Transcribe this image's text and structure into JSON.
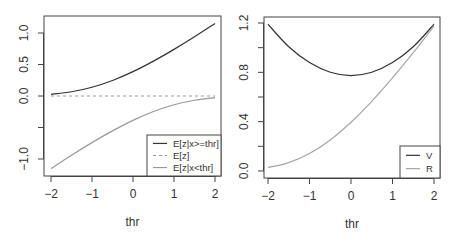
{
  "chart_data": [
    {
      "type": "line",
      "title": "",
      "xlabel": "thr",
      "ylabel": "",
      "xlim": [
        -2,
        2
      ],
      "ylim": [
        -1.2,
        1.25
      ],
      "x_ticks": [
        -2,
        -1,
        0,
        1,
        2
      ],
      "x_tick_labels": [
        "−2",
        "−1",
        "0",
        "1",
        "2"
      ],
      "y_ticks": [
        -1.0,
        -0.5,
        0.0,
        0.5,
        1.0
      ],
      "y_tick_labels": [
        "−1.0",
        "",
        "0.0",
        "0.5",
        "1.0"
      ],
      "grid": false,
      "legend_position": "bottomright",
      "x": [
        -2,
        -1.5,
        -1,
        -0.5,
        0,
        0.5,
        1,
        1.5,
        2
      ],
      "series": [
        {
          "name": "E[z|x>=thr]",
          "style": "solid",
          "color": "#333333",
          "values": [
            0.027,
            0.067,
            0.139,
            0.247,
            0.387,
            0.554,
            0.74,
            0.94,
            1.151
          ]
        },
        {
          "name": "E[z]",
          "style": "dashed",
          "color": "#999999",
          "values": [
            0,
            0,
            0,
            0,
            0,
            0,
            0,
            0,
            0
          ]
        },
        {
          "name": "E[z|x<thr]",
          "style": "solid",
          "color": "#999999",
          "values": [
            -1.151,
            -0.94,
            -0.74,
            -0.554,
            -0.387,
            -0.247,
            -0.139,
            -0.067,
            -0.027
          ]
        }
      ]
    },
    {
      "type": "line",
      "title": "",
      "xlabel": "thr",
      "ylabel": "",
      "xlim": [
        -2,
        2
      ],
      "ylim": [
        -0.02,
        1.22
      ],
      "x_ticks": [
        -2,
        -1,
        0,
        1,
        2
      ],
      "x_tick_labels": [
        "−2",
        "−1",
        "0",
        "1",
        "2"
      ],
      "y_ticks": [
        0.0,
        0.2,
        0.4,
        0.6,
        0.8,
        1.0,
        1.2
      ],
      "y_tick_labels": [
        "0.0",
        "",
        "0.4",
        "",
        "0.8",
        "",
        "1.2"
      ],
      "grid": false,
      "legend_position": "bottomright",
      "x": [
        -2,
        -1.5,
        -1,
        -0.5,
        0,
        0.5,
        1,
        1.5,
        2
      ],
      "series": [
        {
          "name": "V",
          "style": "solid",
          "color": "#333333",
          "values": [
            1.19,
            1.007,
            0.879,
            0.801,
            0.774,
            0.801,
            0.879,
            1.007,
            1.19
          ]
        },
        {
          "name": "R",
          "style": "solid",
          "color": "#a6a6a6",
          "values": [
            0.028,
            0.068,
            0.142,
            0.252,
            0.395,
            0.565,
            0.755,
            0.959,
            1.174
          ]
        }
      ]
    }
  ],
  "panels": [
    {
      "box": {
        "x0": 44,
        "x1": 221,
        "y0": 16,
        "y1": 176
      },
      "xmap": {
        "v0": -2,
        "p0": 51,
        "v1": 2,
        "p1": 215
      },
      "ymap": {
        "v0": 0,
        "p0": 96,
        "v1": 1,
        "p1": 33
      },
      "legend": {
        "x0": 147,
        "y0": 135,
        "x1": 221,
        "y1": 176
      }
    },
    {
      "box": {
        "x0": 264,
        "x1": 440,
        "y0": 17,
        "y1": 178
      },
      "xmap": {
        "v0": -2,
        "p0": 268,
        "v1": 2,
        "p1": 434
      },
      "ymap": {
        "v0": 0,
        "p0": 171,
        "v1": 1.2,
        "p1": 23
      },
      "legend": {
        "x0": 400,
        "y0": 146,
        "x1": 440,
        "y1": 178
      }
    }
  ]
}
